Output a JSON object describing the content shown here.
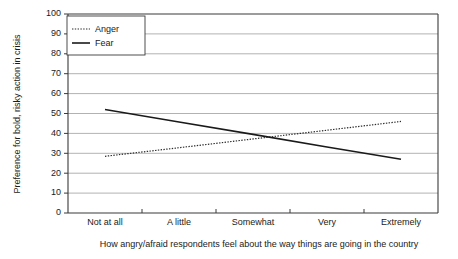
{
  "chart_data": {
    "type": "line",
    "title": "",
    "subtitle": "",
    "xlabel": "How angry/afraid respondents feel about the way things are going in the country",
    "ylabel": "Preference for bold, risky action in crisis",
    "categories": [
      "Not at all",
      "A little",
      "Somewhat",
      "Very",
      "Extremely"
    ],
    "ylim": [
      0,
      100
    ],
    "yticks": [
      0,
      10,
      20,
      30,
      40,
      50,
      60,
      70,
      80,
      90,
      100
    ],
    "ytick_labels": [
      "0",
      "10",
      "20",
      "30",
      "40",
      "50",
      "60",
      "70",
      "80",
      "90",
      "100"
    ],
    "grid": "horizontal",
    "legend_position": "top-left-inside",
    "series": [
      {
        "name": "Anger",
        "style": "dotted",
        "color": "#2a2a2a",
        "values": [
          28.5,
          32.8,
          37.2,
          41.6,
          46.0
        ]
      },
      {
        "name": "Fear",
        "style": "solid",
        "color": "#1a1a1a",
        "values": [
          52.0,
          45.7,
          39.5,
          33.2,
          27.0
        ]
      }
    ]
  },
  "legend": {
    "items": [
      {
        "label": "Anger",
        "style": "dotted"
      },
      {
        "label": "Fear",
        "style": "solid"
      }
    ]
  },
  "colors": {
    "axis": "#3a3a3a",
    "grid": "#7d7d7d",
    "anger": "#2a2a2a",
    "fear": "#1a1a1a",
    "background": "#ffffff"
  }
}
